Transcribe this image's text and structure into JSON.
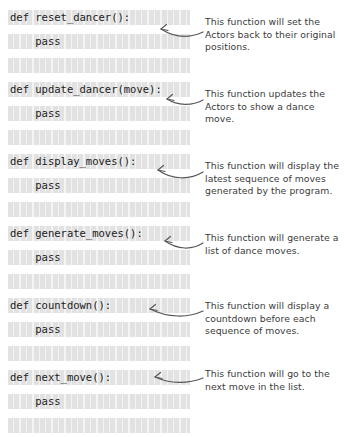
{
  "code_panel": {
    "language": "python",
    "lines": [
      {
        "text": "def reset_dancer():",
        "indent": 0,
        "blank": false
      },
      {
        "text": "    pass",
        "indent": 4,
        "blank": false
      },
      {
        "text": "",
        "indent": 0,
        "blank": true
      },
      {
        "text": "def update_dancer(move):",
        "indent": 0,
        "blank": false
      },
      {
        "text": "    pass",
        "indent": 4,
        "blank": false
      },
      {
        "text": "",
        "indent": 0,
        "blank": true
      },
      {
        "text": "def display_moves():",
        "indent": 0,
        "blank": false
      },
      {
        "text": "    pass",
        "indent": 4,
        "blank": false
      },
      {
        "text": "",
        "indent": 0,
        "blank": true
      },
      {
        "text": "def generate_moves():",
        "indent": 0,
        "blank": false
      },
      {
        "text": "    pass",
        "indent": 4,
        "blank": false
      },
      {
        "text": "",
        "indent": 0,
        "blank": true
      },
      {
        "text": "def countdown():",
        "indent": 0,
        "blank": false
      },
      {
        "text": "    pass",
        "indent": 4,
        "blank": false
      },
      {
        "text": "",
        "indent": 0,
        "blank": true
      },
      {
        "text": "def next_move():",
        "indent": 0,
        "blank": false
      },
      {
        "text": "    pass",
        "indent": 4,
        "blank": false
      },
      {
        "text": "",
        "indent": 0,
        "blank": true
      }
    ]
  },
  "annotations": [
    {
      "id": "reset-dancer",
      "text": "This function will set the Actors back to their original positions."
    },
    {
      "id": "update-dancer",
      "text": "This function updates the Actors to show a dance move."
    },
    {
      "id": "display-moves",
      "text": "This function will display the latest sequence of moves generated by the program."
    },
    {
      "id": "generate-moves",
      "text": "This function will generate a list of dance moves."
    },
    {
      "id": "countdown",
      "text": "This function will display a countdown before each sequence of moves."
    },
    {
      "id": "next-move",
      "text": "This function will go to the next move in the list."
    }
  ],
  "colors": {
    "code_text": "#1a1a1a",
    "annotation_text": "#3b3b3b",
    "arrow": "#595959",
    "cell_fill": "#e2e2e2",
    "page_background": "#ffffff"
  }
}
